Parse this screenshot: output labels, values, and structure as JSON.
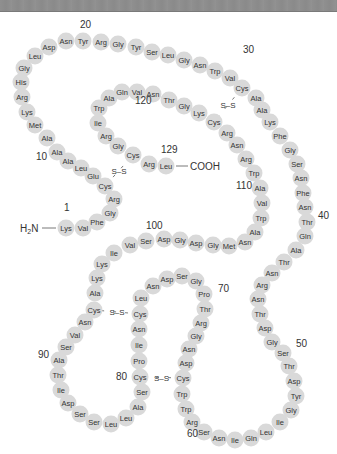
{
  "colors": {
    "residue_fill": "#d9d9d9",
    "text": "#333333",
    "background": "#ffffff",
    "topbar": "#8f8f8f"
  },
  "termini": {
    "n": "H2N",
    "c": "COOH"
  },
  "position_labels": [
    {
      "label": "1",
      "x": 64,
      "y": 211
    },
    {
      "label": "10",
      "x": 36,
      "y": 160
    },
    {
      "label": "20",
      "x": 80,
      "y": 28
    },
    {
      "label": "30",
      "x": 243,
      "y": 53
    },
    {
      "label": "40",
      "x": 318,
      "y": 219
    },
    {
      "label": "50",
      "x": 296,
      "y": 347
    },
    {
      "label": "60",
      "x": 187,
      "y": 437
    },
    {
      "label": "70",
      "x": 218,
      "y": 292
    },
    {
      "label": "80",
      "x": 116,
      "y": 380
    },
    {
      "label": "90",
      "x": 38,
      "y": 358
    },
    {
      "label": "100",
      "x": 146,
      "y": 229
    },
    {
      "label": "110",
      "x": 236,
      "y": 189
    },
    {
      "label": "120",
      "x": 135,
      "y": 104
    },
    {
      "label": "129",
      "x": 161,
      "y": 153
    }
  ],
  "residues": [
    {
      "n": 1,
      "aa": "Lys",
      "x": 66,
      "y": 228
    },
    {
      "n": 2,
      "aa": "Val",
      "x": 83,
      "y": 228
    },
    {
      "n": 3,
      "aa": "Phe",
      "x": 97,
      "y": 222
    },
    {
      "n": 4,
      "aa": "Gly",
      "x": 110,
      "y": 213
    },
    {
      "n": 5,
      "aa": "Arg",
      "x": 114,
      "y": 199
    },
    {
      "n": 6,
      "aa": "Cys",
      "x": 105,
      "y": 186
    },
    {
      "n": 7,
      "aa": "Glu",
      "x": 93,
      "y": 176
    },
    {
      "n": 8,
      "aa": "Leu",
      "x": 81,
      "y": 168
    },
    {
      "n": 9,
      "aa": "Ala",
      "x": 68,
      "y": 161
    },
    {
      "n": 10,
      "aa": "Ala",
      "x": 57,
      "y": 152
    },
    {
      "n": 11,
      "aa": "Ala",
      "x": 47,
      "y": 138
    },
    {
      "n": 12,
      "aa": "Met",
      "x": 35,
      "y": 125
    },
    {
      "n": 13,
      "aa": "Lys",
      "x": 27,
      "y": 112
    },
    {
      "n": 14,
      "aa": "Arg",
      "x": 22,
      "y": 97
    },
    {
      "n": 15,
      "aa": "His",
      "x": 21,
      "y": 82
    },
    {
      "n": 16,
      "aa": "Gly",
      "x": 24,
      "y": 68
    },
    {
      "n": 17,
      "aa": "Leu",
      "x": 35,
      "y": 56
    },
    {
      "n": 18,
      "aa": "Asp",
      "x": 49,
      "y": 47
    },
    {
      "n": 19,
      "aa": "Asn",
      "x": 66,
      "y": 41
    },
    {
      "n": 20,
      "aa": "Tyr",
      "x": 83,
      "y": 41
    },
    {
      "n": 21,
      "aa": "Arg",
      "x": 101,
      "y": 42
    },
    {
      "n": 22,
      "aa": "Gly",
      "x": 118,
      "y": 44
    },
    {
      "n": 23,
      "aa": "Tyr",
      "x": 136,
      "y": 47
    },
    {
      "n": 24,
      "aa": "Ser",
      "x": 152,
      "y": 52
    },
    {
      "n": 25,
      "aa": "Leu",
      "x": 168,
      "y": 55
    },
    {
      "n": 26,
      "aa": "Gly",
      "x": 184,
      "y": 60
    },
    {
      "n": 27,
      "aa": "Asn",
      "x": 200,
      "y": 65
    },
    {
      "n": 28,
      "aa": "Trp",
      "x": 215,
      "y": 71
    },
    {
      "n": 29,
      "aa": "Val",
      "x": 230,
      "y": 78
    },
    {
      "n": 30,
      "aa": "Cys",
      "x": 242,
      "y": 88
    },
    {
      "n": 31,
      "aa": "Ala",
      "x": 256,
      "y": 98
    },
    {
      "n": 32,
      "aa": "Ala",
      "x": 262,
      "y": 110
    },
    {
      "n": 33,
      "aa": "Lys",
      "x": 270,
      "y": 122
    },
    {
      "n": 34,
      "aa": "Phe",
      "x": 280,
      "y": 136
    },
    {
      "n": 35,
      "aa": "Gly",
      "x": 290,
      "y": 150
    },
    {
      "n": 36,
      "aa": "Ser",
      "x": 297,
      "y": 164
    },
    {
      "n": 37,
      "aa": "Asn",
      "x": 301,
      "y": 178
    },
    {
      "n": 38,
      "aa": "Phe",
      "x": 303,
      "y": 193
    },
    {
      "n": 39,
      "aa": "Asn",
      "x": 305,
      "y": 207
    },
    {
      "n": 40,
      "aa": "Thr",
      "x": 307,
      "y": 222
    },
    {
      "n": 41,
      "aa": "Gln",
      "x": 305,
      "y": 236
    },
    {
      "n": 42,
      "aa": "Ala",
      "x": 296,
      "y": 250
    },
    {
      "n": 43,
      "aa": "Thr",
      "x": 284,
      "y": 262
    },
    {
      "n": 44,
      "aa": "Asn",
      "x": 272,
      "y": 273
    },
    {
      "n": 45,
      "aa": "Arg",
      "x": 262,
      "y": 285
    },
    {
      "n": 46,
      "aa": "Asn",
      "x": 258,
      "y": 299
    },
    {
      "n": 47,
      "aa": "Thr",
      "x": 260,
      "y": 314
    },
    {
      "n": 48,
      "aa": "Asp",
      "x": 265,
      "y": 328
    },
    {
      "n": 49,
      "aa": "Gly",
      "x": 272,
      "y": 342
    },
    {
      "n": 50,
      "aa": "Ser",
      "x": 283,
      "y": 353
    },
    {
      "n": 51,
      "aa": "Thr",
      "x": 289,
      "y": 366
    },
    {
      "n": 52,
      "aa": "Asp",
      "x": 294,
      "y": 381
    },
    {
      "n": 53,
      "aa": "Tyr",
      "x": 296,
      "y": 396
    },
    {
      "n": 54,
      "aa": "Gly",
      "x": 291,
      "y": 410
    },
    {
      "n": 55,
      "aa": "Ile",
      "x": 280,
      "y": 422
    },
    {
      "n": 56,
      "aa": "Leu",
      "x": 266,
      "y": 432
    },
    {
      "n": 57,
      "aa": "Gln",
      "x": 251,
      "y": 438
    },
    {
      "n": 58,
      "aa": "Ile",
      "x": 235,
      "y": 440
    },
    {
      "n": 59,
      "aa": "Asn",
      "x": 219,
      "y": 438
    },
    {
      "n": 60,
      "aa": "Ser",
      "x": 204,
      "y": 432
    },
    {
      "n": 61,
      "aa": "Arg",
      "x": 192,
      "y": 422
    },
    {
      "n": 62,
      "aa": "Trp",
      "x": 186,
      "y": 409
    },
    {
      "n": 63,
      "aa": "Trp",
      "x": 182,
      "y": 394
    },
    {
      "n": 64,
      "aa": "Cys",
      "x": 183,
      "y": 378
    },
    {
      "n": 65,
      "aa": "Asp",
      "x": 186,
      "y": 363
    },
    {
      "n": 66,
      "aa": "Asn",
      "x": 189,
      "y": 349
    },
    {
      "n": 67,
      "aa": "Gly",
      "x": 196,
      "y": 336
    },
    {
      "n": 68,
      "aa": "Arg",
      "x": 201,
      "y": 323
    },
    {
      "n": 69,
      "aa": "Thr",
      "x": 205,
      "y": 309
    },
    {
      "n": 70,
      "aa": "Pro",
      "x": 204,
      "y": 294
    },
    {
      "n": 71,
      "aa": "Gly",
      "x": 196,
      "y": 281
    },
    {
      "n": 72,
      "aa": "Ser",
      "x": 182,
      "y": 276
    },
    {
      "n": 73,
      "aa": "Asp",
      "x": 167,
      "y": 279
    },
    {
      "n": 74,
      "aa": "Asn",
      "x": 153,
      "y": 286
    },
    {
      "n": 75,
      "aa": "Leu",
      "x": 141,
      "y": 298
    },
    {
      "n": 76,
      "aa": "Cys",
      "x": 140,
      "y": 314
    },
    {
      "n": 77,
      "aa": "Asn",
      "x": 139,
      "y": 329
    },
    {
      "n": 78,
      "aa": "Ile",
      "x": 139,
      "y": 345
    },
    {
      "n": 79,
      "aa": "Pro",
      "x": 139,
      "y": 361
    },
    {
      "n": 80,
      "aa": "Cys",
      "x": 140,
      "y": 377
    },
    {
      "n": 81,
      "aa": "Ser",
      "x": 142,
      "y": 392
    },
    {
      "n": 82,
      "aa": "Ala",
      "x": 138,
      "y": 407
    },
    {
      "n": 83,
      "aa": "Leu",
      "x": 126,
      "y": 418
    },
    {
      "n": 84,
      "aa": "Leu",
      "x": 111,
      "y": 424
    },
    {
      "n": 85,
      "aa": "Ser",
      "x": 94,
      "y": 422
    },
    {
      "n": 86,
      "aa": "Ser",
      "x": 80,
      "y": 414
    },
    {
      "n": 87,
      "aa": "Asp",
      "x": 68,
      "y": 403
    },
    {
      "n": 88,
      "aa": "Ile",
      "x": 61,
      "y": 390
    },
    {
      "n": 89,
      "aa": "Thr",
      "x": 58,
      "y": 375
    },
    {
      "n": 90,
      "aa": "Ala",
      "x": 59,
      "y": 360
    },
    {
      "n": 91,
      "aa": "Ser",
      "x": 66,
      "y": 347
    },
    {
      "n": 92,
      "aa": "Val",
      "x": 75,
      "y": 335
    },
    {
      "n": 93,
      "aa": "Asn",
      "x": 85,
      "y": 322
    },
    {
      "n": 94,
      "aa": "Cys",
      "x": 94,
      "y": 310
    },
    {
      "n": 95,
      "aa": "Ala",
      "x": 95,
      "y": 293
    },
    {
      "n": 96,
      "aa": "Lys",
      "x": 97,
      "y": 278
    },
    {
      "n": 97,
      "aa": "Lys",
      "x": 102,
      "y": 264
    },
    {
      "n": 98,
      "aa": "Ile",
      "x": 114,
      "y": 253
    },
    {
      "n": 99,
      "aa": "Val",
      "x": 130,
      "y": 245
    },
    {
      "n": 100,
      "aa": "Ser",
      "x": 146,
      "y": 241
    },
    {
      "n": 101,
      "aa": "Asp",
      "x": 164,
      "y": 239
    },
    {
      "n": 102,
      "aa": "Gly",
      "x": 180,
      "y": 240
    },
    {
      "n": 103,
      "aa": "Asp",
      "x": 196,
      "y": 243
    },
    {
      "n": 104,
      "aa": "Gly",
      "x": 213,
      "y": 245
    },
    {
      "n": 105,
      "aa": "Met",
      "x": 229,
      "y": 246
    },
    {
      "n": 106,
      "aa": "Asn",
      "x": 245,
      "y": 242
    },
    {
      "n": 107,
      "aa": "Ala",
      "x": 255,
      "y": 232
    },
    {
      "n": 108,
      "aa": "Trp",
      "x": 261,
      "y": 218
    },
    {
      "n": 109,
      "aa": "Val",
      "x": 262,
      "y": 203
    },
    {
      "n": 110,
      "aa": "Ala",
      "x": 260,
      "y": 188
    },
    {
      "n": 111,
      "aa": "Trp",
      "x": 254,
      "y": 173
    },
    {
      "n": 112,
      "aa": "Arg",
      "x": 246,
      "y": 159
    },
    {
      "n": 113,
      "aa": "Asn",
      "x": 237,
      "y": 145
    },
    {
      "n": 114,
      "aa": "Arg",
      "x": 227,
      "y": 133
    },
    {
      "n": 115,
      "aa": "Cys",
      "x": 214,
      "y": 122
    },
    {
      "n": 116,
      "aa": "Lys",
      "x": 199,
      "y": 113
    },
    {
      "n": 117,
      "aa": "Gly",
      "x": 184,
      "y": 106
    },
    {
      "n": 118,
      "aa": "Thr",
      "x": 169,
      "y": 100
    },
    {
      "n": 119,
      "aa": "Asn",
      "x": 153,
      "y": 94
    },
    {
      "n": 120,
      "aa": "Val",
      "x": 137,
      "y": 92
    },
    {
      "n": 121,
      "aa": "Gln",
      "x": 122,
      "y": 92
    },
    {
      "n": 122,
      "aa": "Ala",
      "x": 109,
      "y": 98
    },
    {
      "n": 123,
      "aa": "Trp",
      "x": 99,
      "y": 108
    },
    {
      "n": 124,
      "aa": "Ile",
      "x": 98,
      "y": 123
    },
    {
      "n": 125,
      "aa": "Arg",
      "x": 106,
      "y": 136
    },
    {
      "n": 126,
      "aa": "Gly",
      "x": 118,
      "y": 146
    },
    {
      "n": 127,
      "aa": "Cys",
      "x": 133,
      "y": 155
    },
    {
      "n": 128,
      "aa": "Arg",
      "x": 149,
      "y": 164
    },
    {
      "n": 129,
      "aa": "Leu",
      "x": 166,
      "y": 166
    }
  ],
  "disulfide_bonds": [
    {
      "from": 6,
      "to": 127,
      "label": "S–S"
    },
    {
      "from": 30,
      "to": 115,
      "label": "S–S"
    },
    {
      "from": 64,
      "to": 80,
      "label": "S–S"
    },
    {
      "from": 76,
      "to": 94,
      "label": "S–S"
    }
  ]
}
